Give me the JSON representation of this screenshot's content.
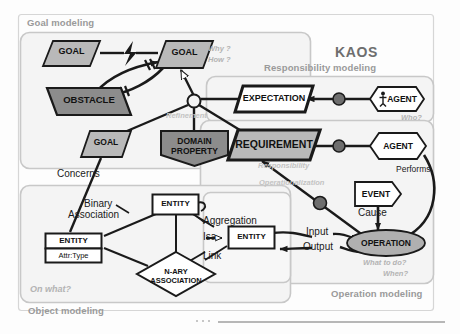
{
  "title": "KAOS",
  "panels": [
    {
      "key": "goal",
      "label": "Goal modeling"
    },
    {
      "key": "responsibility",
      "label": "Responsibility modeling"
    },
    {
      "key": "object",
      "label": "Object modeling"
    },
    {
      "key": "operation",
      "label": "Operation modeling"
    }
  ],
  "hints": [
    {
      "key": "why",
      "text": "Why ?"
    },
    {
      "key": "how",
      "text": "How ?"
    },
    {
      "key": "who",
      "text": "Who?"
    },
    {
      "key": "onwhat",
      "text": "On what?"
    },
    {
      "key": "whattodo",
      "text": "What to do?"
    },
    {
      "key": "when",
      "text": "When?"
    }
  ],
  "nodes": {
    "goal_left": {
      "label": "GOAL",
      "type": "parallelogram"
    },
    "goal_right": {
      "label": "GOAL",
      "type": "parallelogram"
    },
    "goal_bottom": {
      "label": "GOAL",
      "type": "parallelogram"
    },
    "obstacle": {
      "label": "OBSTACLE",
      "type": "parallelogram-reverse"
    },
    "domain_property": {
      "label_line1": "DOMAIN",
      "label_line2": "PROPERTY",
      "type": "home-plate"
    },
    "expectation": {
      "label": "EXPECTATION",
      "type": "parallelogram"
    },
    "requirement": {
      "label": "REQUIREMENT",
      "type": "parallelogram"
    },
    "agent_top": {
      "label": "AGENT",
      "type": "hexagon"
    },
    "agent_bottom": {
      "label": "AGENT",
      "type": "hexagon"
    },
    "event": {
      "label": "EVENT",
      "type": "chevron"
    },
    "operation": {
      "label": "OPERATION",
      "type": "ellipse"
    },
    "entity_top": {
      "label": "ENTITY",
      "type": "rect"
    },
    "entity_right": {
      "label": "ENTITY",
      "type": "rect"
    },
    "entity_attr": {
      "label": "ENTITY",
      "attribute": "Attr:Type",
      "type": "rect-attr"
    },
    "nary": {
      "label_line1": "N-ARY",
      "label_line2": "ASSOCIATION",
      "type": "diamond"
    }
  },
  "edge_labels": [
    {
      "key": "refinement",
      "text": "Refinement",
      "style": "ghost"
    },
    {
      "key": "concerns",
      "text": "Concerns",
      "style": "solid"
    },
    {
      "key": "responsibility",
      "text": "Responsibility",
      "style": "ghost"
    },
    {
      "key": "operationalization",
      "text": "Operationalization",
      "style": "ghost"
    },
    {
      "key": "performs",
      "text": "Performs",
      "style": "solid"
    },
    {
      "key": "cause",
      "text": "Cause",
      "style": "solid"
    },
    {
      "key": "input",
      "text": "Input",
      "style": "solid"
    },
    {
      "key": "output",
      "text": "Output",
      "style": "solid"
    },
    {
      "key": "binary_association1",
      "text": "Binary",
      "style": "solid"
    },
    {
      "key": "binary_association2",
      "text": "Association",
      "style": "solid"
    },
    {
      "key": "aggregation",
      "text": "Aggregation",
      "style": "solid"
    },
    {
      "key": "isa",
      "text": "Isa",
      "style": "solid"
    },
    {
      "key": "link",
      "text": "Link",
      "style": "solid"
    }
  ],
  "colors": {
    "goal_fill": "#b9b9b9",
    "obstacle_fill": "#8c8c8c",
    "domain_fill": "#8c8c8c",
    "requirement_fill": "#b9b9b9",
    "expectation_fill": "#ffffff",
    "operation_fill": "#b0b0b0",
    "agent_fill": "#ffffff",
    "panel_border": "#c8c8c8",
    "panel_fill": "#f4f4f4",
    "stroke": "#1a1a1a",
    "label_gray": "#9a9a9a",
    "hint_gray": "#b3b3b3"
  }
}
